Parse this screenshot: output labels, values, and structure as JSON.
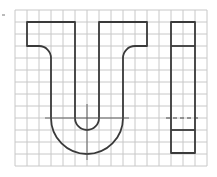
{
  "figure": {
    "grid": {
      "columns": 16,
      "rows": 13
    },
    "views": [
      {
        "name": "front-view",
        "description": "U-shaped profile with top flanges and semicircular base"
      },
      {
        "name": "side-view",
        "description": "Rectangular side view with hidden (dashed) line"
      }
    ],
    "colors": {
      "grid": "#c8c8c8",
      "outline": "#3a3a3a",
      "background": "#ffffff"
    }
  }
}
